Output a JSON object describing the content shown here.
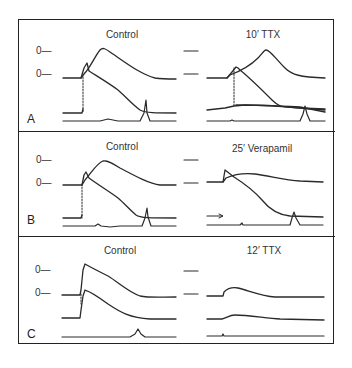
{
  "figure": {
    "panels": [
      {
        "letter": "A",
        "left_title": "Control",
        "right_title": "10′ TTX",
        "zero_labels": [
          "0—",
          "0—"
        ]
      },
      {
        "letter": "B",
        "left_title": "Control",
        "right_title": "25′ Verapamil",
        "zero_labels": [
          "0—",
          "0—"
        ]
      },
      {
        "letter": "C",
        "left_title": "Control",
        "right_title": "12′ TTX",
        "zero_labels": [
          "0—",
          "0—"
        ]
      }
    ],
    "colors": {
      "ink": "#2a2a2a",
      "background": "#ffffff"
    }
  }
}
